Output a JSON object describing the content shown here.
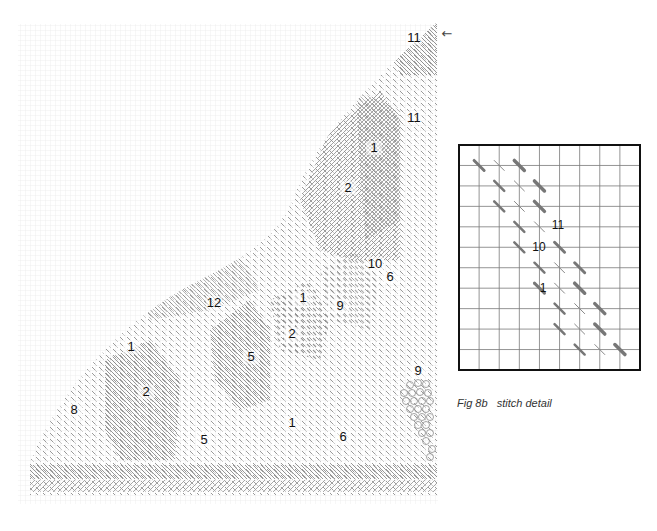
{
  "figure": {
    "main_diagram": {
      "name": "needlepoint-stitch-chart",
      "start_marker": "←",
      "stitch_labels": [
        {
          "text": "11",
          "x": 414,
          "y": 42
        },
        {
          "text": "11",
          "x": 414,
          "y": 122
        },
        {
          "text": "1",
          "x": 374,
          "y": 152
        },
        {
          "text": "2",
          "x": 348,
          "y": 192
        },
        {
          "text": "10",
          "x": 375,
          "y": 268
        },
        {
          "text": "6",
          "x": 390,
          "y": 281
        },
        {
          "text": "12",
          "x": 214,
          "y": 307
        },
        {
          "text": "1",
          "x": 303,
          "y": 302
        },
        {
          "text": "9",
          "x": 340,
          "y": 310
        },
        {
          "text": "2",
          "x": 292,
          "y": 338
        },
        {
          "text": "1",
          "x": 131,
          "y": 351
        },
        {
          "text": "5",
          "x": 251,
          "y": 361
        },
        {
          "text": "9",
          "x": 418,
          "y": 375
        },
        {
          "text": "2",
          "x": 146,
          "y": 396
        },
        {
          "text": "8",
          "x": 74,
          "y": 414
        },
        {
          "text": "1",
          "x": 292,
          "y": 427
        },
        {
          "text": "6",
          "x": 343,
          "y": 441
        },
        {
          "text": "5",
          "x": 204,
          "y": 444
        }
      ]
    },
    "detail_inset": {
      "name": "stitch-detail-grid",
      "columns": 9,
      "rows": 11,
      "labels": [
        {
          "text": "11",
          "x": 558,
          "y": 229
        },
        {
          "text": "10",
          "x": 539,
          "y": 251
        },
        {
          "text": "1",
          "x": 543,
          "y": 292
        }
      ]
    },
    "caption": "Fig 8b   stitch detail"
  },
  "colors": {
    "grid": "#e3e3e3",
    "stitch": "#8a8a8a",
    "stitch_dark": "#6d6d6d",
    "inset_border": "#111111",
    "inset_grid": "#7a7a7a"
  }
}
